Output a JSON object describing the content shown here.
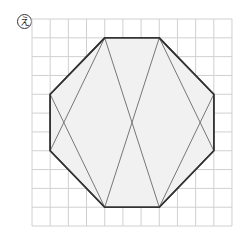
{
  "figure": {
    "label": "え",
    "grid": {
      "origin_px": [
        32,
        19
      ],
      "cell_w_px": 18.18,
      "cell_h_px": 18.82,
      "cols": 11,
      "rows": 11,
      "line_color": "#d0d0d0"
    },
    "shape": {
      "type": "octagon",
      "fill": "#f1f1f1",
      "stroke": "#333333",
      "vertices_grid": [
        [
          4,
          1
        ],
        [
          7,
          1
        ],
        [
          10,
          4
        ],
        [
          10,
          7
        ],
        [
          7,
          10
        ],
        [
          4,
          10
        ],
        [
          1,
          7
        ],
        [
          1,
          4
        ]
      ]
    },
    "diagonals": {
      "stroke": "#777777",
      "segments_grid": [
        [
          [
            4,
            1
          ],
          [
            7,
            10
          ]
        ],
        [
          [
            7,
            1
          ],
          [
            4,
            10
          ]
        ],
        [
          [
            4,
            1
          ],
          [
            1,
            7
          ]
        ],
        [
          [
            1,
            4
          ],
          [
            4,
            10
          ]
        ],
        [
          [
            7,
            1
          ],
          [
            10,
            7
          ]
        ],
        [
          [
            10,
            4
          ],
          [
            7,
            10
          ]
        ]
      ]
    }
  }
}
